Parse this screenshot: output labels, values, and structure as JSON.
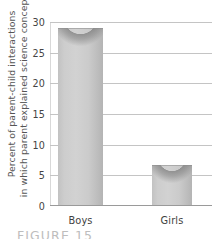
{
  "chart_data": {
    "type": "bar",
    "title": "",
    "xlabel": "",
    "ylabel": "Percent of parent-child interactions in which parent explained science concepts",
    "ylabel_lines": [
      "Percent of parent-child interactions",
      "in which parent explained science concepts"
    ],
    "categories": [
      "Boys",
      "Girls"
    ],
    "values": [
      28.8,
      6.5
    ],
    "ylim": [
      0,
      30
    ],
    "yticks": [
      30,
      25,
      20,
      15,
      10,
      5,
      0
    ],
    "ytick_labels": [
      "30",
      "25",
      "20",
      "15",
      "10",
      "5",
      "0"
    ],
    "grid": true,
    "legend": "none",
    "bar_color": "#c8c8c8",
    "gridline_color": "#c4c4c4",
    "axis_color": "#9a9a9a",
    "text_color": "#3f3f3f"
  },
  "caption": {
    "text": "FIGURE 15",
    "note": "partially cut off at bottom edge"
  }
}
